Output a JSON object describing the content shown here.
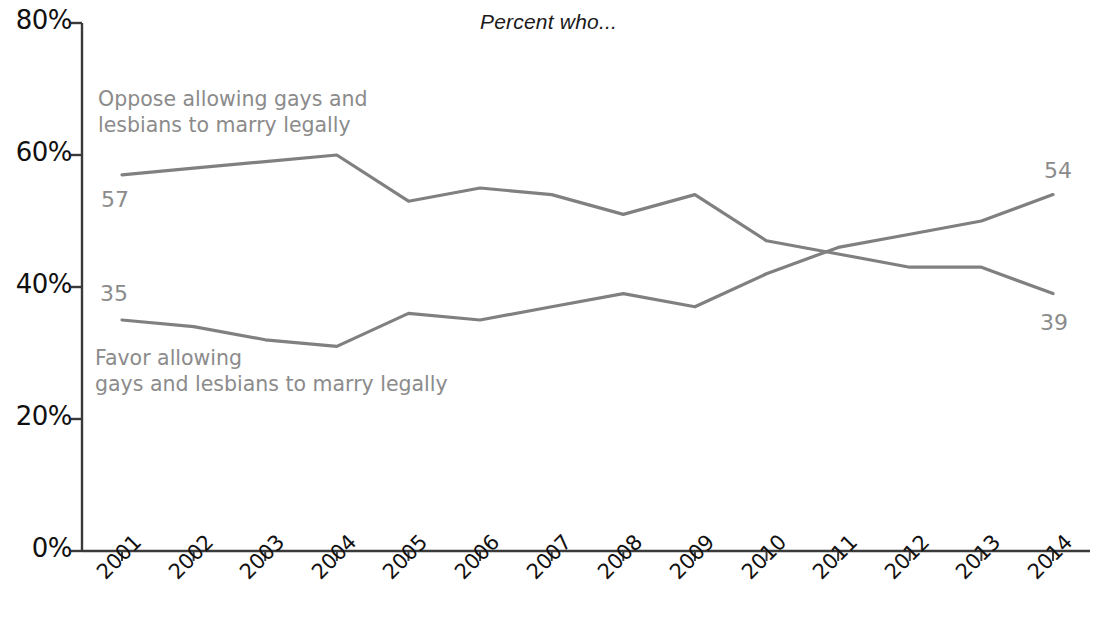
{
  "chart_data": {
    "type": "line",
    "title": "Percent who...",
    "xlabel": "",
    "ylabel": "",
    "categories": [
      "2001",
      "2002",
      "2003",
      "2004",
      "2005",
      "2006",
      "2007",
      "2008",
      "2009",
      "2010",
      "2011",
      "2012",
      "2013",
      "2014"
    ],
    "ylim": [
      0,
      80
    ],
    "yticks": [
      0,
      20,
      40,
      60,
      80
    ],
    "ytick_labels": [
      "0%",
      "20%",
      "40%",
      "60%",
      "80%"
    ],
    "grid": false,
    "legend_position": "inline-annotations",
    "series": [
      {
        "name": "Oppose allowing gays and lesbians to marry legally",
        "label_text": "Oppose allowing gays and\nlesbians to marry legally",
        "color": "#808080",
        "start_value_label": "57",
        "end_value_label": "39",
        "values": [
          57,
          58,
          59,
          60,
          53,
          55,
          54,
          51,
          54,
          47,
          45,
          43,
          43,
          39
        ]
      },
      {
        "name": "Favor allowing gays and lesbians to marry legally",
        "label_text": "Favor allowing\ngays and lesbians to marry legally",
        "color": "#808080",
        "start_value_label": "35",
        "end_value_label": "54",
        "values": [
          35,
          34,
          32,
          31,
          36,
          35,
          37,
          39,
          37,
          42,
          46,
          48,
          50,
          54
        ]
      }
    ],
    "annotations": [
      {
        "name": "oppose-start-value",
        "text": "57"
      },
      {
        "name": "favor-start-value",
        "text": "35"
      },
      {
        "name": "favor-end-value",
        "text": "54"
      },
      {
        "name": "oppose-end-value",
        "text": "39"
      }
    ]
  },
  "axis": {
    "line_color": "#3a3a3a"
  }
}
